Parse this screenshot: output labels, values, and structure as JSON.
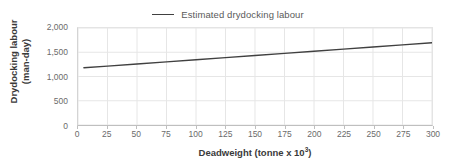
{
  "legend": {
    "entries": [
      {
        "label": "Estimated drydocking labour",
        "color": "#404040",
        "marker": "line-swatch"
      }
    ]
  },
  "axes": {
    "x_title_main": "Deadweight (tonne x 10",
    "x_title_sup": "3",
    "x_title_tail": ")",
    "y_title_line1": "Drydocking labour",
    "y_title_line2": "(man-day)",
    "x_ticks": [
      "0",
      "25",
      "50",
      "75",
      "100",
      "125",
      "150",
      "175",
      "200",
      "225",
      "250",
      "275",
      "300"
    ],
    "y_ticks": [
      "0",
      "500",
      "1,000",
      "1,500",
      "2,000"
    ]
  },
  "chart_data": {
    "type": "line",
    "title": "",
    "subtitle": "",
    "xlabel": "Deadweight (tonne x 10³)",
    "ylabel": "Drydocking labour (man-day)",
    "xlim": [
      0,
      300
    ],
    "ylim": [
      0,
      2000
    ],
    "xtick_values": [
      0,
      25,
      50,
      75,
      100,
      125,
      150,
      175,
      200,
      225,
      250,
      275,
      300
    ],
    "ytick_values": [
      0,
      500,
      1000,
      1500,
      2000
    ],
    "xtick_labels": [
      "0",
      "25",
      "50",
      "75",
      "100",
      "125",
      "150",
      "175",
      "200",
      "225",
      "250",
      "275",
      "300"
    ],
    "ytick_labels": [
      "0",
      "500",
      "1,000",
      "1,500",
      "2,000"
    ],
    "grid": true,
    "grid_axis": "both",
    "grid_color": "#e6e6e6",
    "legend_position": "top-center",
    "series": [
      {
        "name": "Estimated drydocking labour",
        "color": "#404040",
        "line_width": 1.4,
        "x": [
          5,
          25,
          50,
          75,
          100,
          125,
          150,
          175,
          200,
          225,
          250,
          275,
          300
        ],
        "values": [
          1180,
          1215,
          1259,
          1302,
          1346,
          1390,
          1434,
          1477,
          1521,
          1565,
          1608,
          1652,
          1696
        ]
      }
    ],
    "annotations": []
  },
  "colors": {
    "series_line": "#404040",
    "grid": "#e6e6e6",
    "axis_line": "#bfbfbf",
    "tick_text": "#6b6b6b",
    "title_text": "#3a3a3a",
    "background": "#ffffff"
  }
}
